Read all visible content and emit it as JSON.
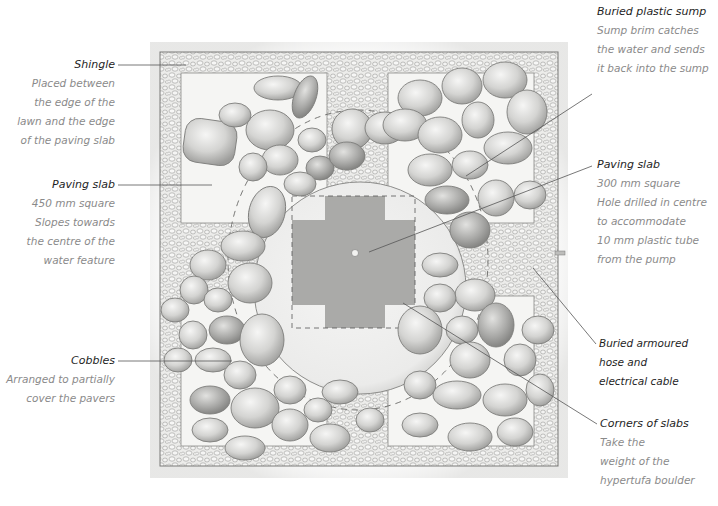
{
  "diagram": {
    "type": "annotated-illustration",
    "colors": {
      "title_text": "#1e1e1e",
      "body_text": "#8a8a8a",
      "leader_line": "#555555",
      "shingle_fill": "#e6e6e4",
      "slab_fill": "#f4f4f2",
      "cross_fill": "#9a9a98",
      "boulder_fill": "#ededeb",
      "cobble_fill": "#d2d2d0",
      "cobble_stroke": "#8c8c8a"
    }
  },
  "labels": {
    "shingle": {
      "title": "Shingle",
      "lines": [
        "Placed between",
        "the edge of the",
        "lawn and the edge",
        "of the paving slab"
      ]
    },
    "paving_slab_450": {
      "title": "Paving slab",
      "lines": [
        "450 mm square",
        "Slopes towards",
        "the centre of the",
        "water feature"
      ]
    },
    "cobbles": {
      "title": "Cobbles",
      "lines": [
        "Arranged to partially",
        "cover the pavers"
      ]
    },
    "buried_sump": {
      "title": "Buried plastic sump",
      "lines": [
        "Sump brim catches",
        "the water and sends",
        "it back into the sump"
      ]
    },
    "paving_slab_300": {
      "title": "Paving slab",
      "lines": [
        "300 mm square",
        "Hole drilled in centre",
        "to accommodate",
        "10 mm plastic tube",
        "from the pump"
      ]
    },
    "buried_hose": {
      "title": "",
      "lines": [
        "Buried armoured",
        "hose and",
        "electrical cable"
      ]
    },
    "corners_of_slabs": {
      "title": "Corners of slabs",
      "lines": [
        "Take the",
        "weight of the",
        "hypertufa boulder"
      ]
    }
  }
}
